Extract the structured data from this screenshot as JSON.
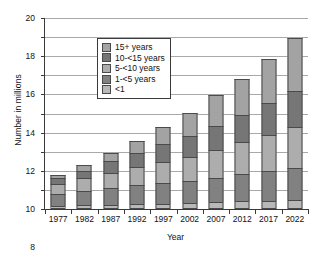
{
  "chart_data": {
    "type": "bar",
    "subtype": "stacked-bar",
    "title": "",
    "xlabel": "Year",
    "ylabel": "Number in millions",
    "categories": [
      "1977",
      "1982",
      "1987",
      "1992",
      "1997",
      "2002",
      "2007",
      "2012",
      "2017",
      "2022"
    ],
    "ylim": [
      0,
      20
    ],
    "yticks": [
      0,
      2,
      4,
      6,
      8,
      10,
      12,
      14,
      16,
      18,
      20
    ],
    "ytick_labels": [
      "0",
      "2",
      "4",
      "6",
      "8",
      "10",
      "12",
      "14",
      "16",
      "18",
      "20"
    ],
    "grid": true,
    "legend_position": "top-left",
    "stack_order_bottom_to_top": [
      "<1",
      "1-<5 years",
      "5-<10 years",
      "10-<15 years",
      "15+ years"
    ],
    "series": [
      {
        "name": "<1",
        "color": "#b8b8b8",
        "values": [
          0.35,
          0.4,
          0.45,
          0.5,
          0.55,
          0.6,
          0.7,
          0.8,
          0.85,
          0.9
        ]
      },
      {
        "name": "1-<5 years",
        "color": "#818181",
        "values": [
          1.25,
          1.5,
          1.75,
          2.0,
          2.15,
          2.3,
          2.6,
          2.9,
          3.15,
          3.4
        ]
      },
      {
        "name": "5-<10 years",
        "color": "#adadad",
        "values": [
          1.0,
          1.3,
          1.6,
          1.9,
          2.2,
          2.5,
          2.9,
          3.3,
          3.8,
          4.3
        ]
      },
      {
        "name": "10-<15 years",
        "color": "#767676",
        "values": [
          0.6,
          0.8,
          1.2,
          1.5,
          1.9,
          2.2,
          2.5,
          2.9,
          3.3,
          3.8
        ]
      },
      {
        "name": "15+ years",
        "color": "#a3a3a3",
        "values": [
          0.4,
          0.6,
          0.9,
          1.2,
          1.8,
          2.5,
          3.2,
          3.7,
          4.6,
          5.5
        ]
      }
    ],
    "totals": [
      3.6,
      4.6,
      5.9,
      7.1,
      8.6,
      10.1,
      11.9,
      13.6,
      15.7,
      17.9
    ]
  },
  "legend": {
    "entries": [
      {
        "label": "15+ years",
        "color": "#a3a3a3"
      },
      {
        "label": "10-<15 years",
        "color": "#767676"
      },
      {
        "label": "5-<10 years",
        "color": "#adadad"
      },
      {
        "label": "1-<5 years",
        "color": "#818181"
      },
      {
        "label": "<1",
        "color": "#b8b8b8"
      }
    ]
  },
  "axes": {
    "x_title": "Year",
    "y_title": "Number in millions"
  }
}
